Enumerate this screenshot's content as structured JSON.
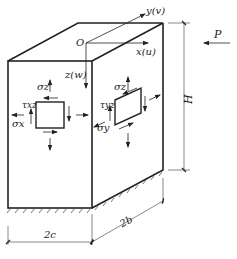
{
  "diagram": {
    "type": "3D block with stress elements",
    "axes": {
      "x": "x(u)",
      "y": "y(v)",
      "z": "z(w)",
      "origin": "O"
    },
    "load": "P",
    "dimensions": {
      "height": "H",
      "width": "2c",
      "depth": "2b"
    },
    "front_element": {
      "normal_x": "σx",
      "shear": "τxz",
      "normal_z": "σz'"
    },
    "side_element": {
      "normal_y": "σy",
      "shear": "τyz",
      "normal_z": "σz"
    },
    "colors": {
      "line": "#222222",
      "dimension_line": "#555555",
      "background": "#ffffff"
    }
  }
}
